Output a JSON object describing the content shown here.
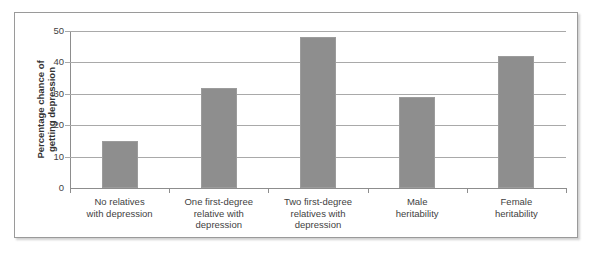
{
  "chart_data": {
    "type": "bar",
    "title": "",
    "subtitle": "",
    "xlabel": "",
    "ylabel_lines": [
      "Percentage chance of",
      "getting depression"
    ],
    "ylabel": "Percentage chance of getting depression",
    "categories": [
      "No relatives\nwith depression",
      "One first-degree\nrelative with\ndepression",
      "Two first-degree\nrelatives with\ndepression",
      "Male\nheritability",
      "Female\nheritability"
    ],
    "category_lines": [
      [
        "No relatives",
        "with depression"
      ],
      [
        "One first-degree",
        "relative with",
        "depression"
      ],
      [
        "Two first-degree",
        "relatives with",
        "depression"
      ],
      [
        "Male",
        "heritability"
      ],
      [
        "Female",
        "heritability"
      ]
    ],
    "values": [
      15,
      32,
      48,
      29,
      42
    ],
    "ylim": [
      0,
      50
    ],
    "ytick_labels": [
      "0",
      "10",
      "20",
      "30",
      "40",
      "50"
    ],
    "ytick_values": [
      0,
      10,
      20,
      30,
      40,
      50
    ],
    "grid": true,
    "legend": false,
    "legend_position": "none",
    "bar_color": "#8e8e8e",
    "bar_border_color": "#9c9c9c",
    "gridline_color": "#a9a9a9",
    "axis_color": "#8d8d8d",
    "frame_color": "#9a9a9a",
    "background_color": "#ffffff"
  }
}
